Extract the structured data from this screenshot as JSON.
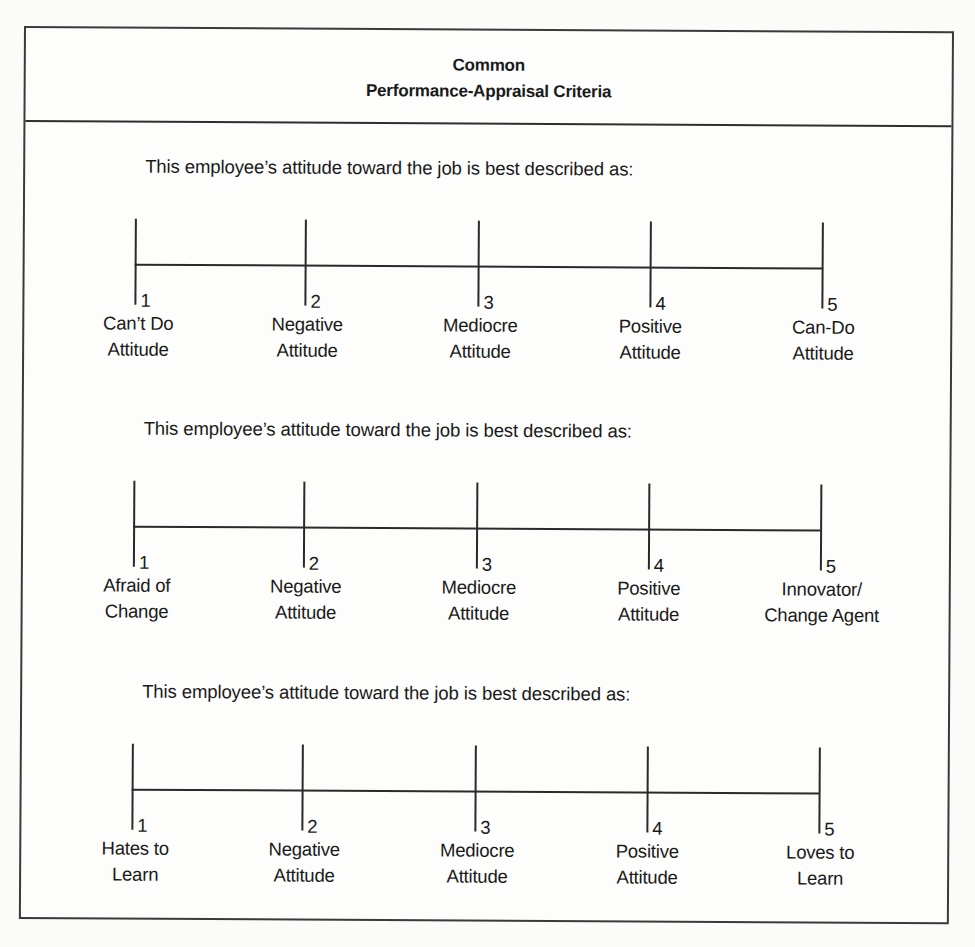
{
  "document": {
    "title_line1": "Common",
    "title_line2": "Performance-Appraisal Criteria"
  },
  "scales": [
    {
      "prompt": "This employee’s attitude toward the job is best described as:",
      "points": [
        {
          "number": "1",
          "label_line1": "Can’t Do",
          "label_line2": "Attitude"
        },
        {
          "number": "2",
          "label_line1": "Negative",
          "label_line2": "Attitude"
        },
        {
          "number": "3",
          "label_line1": "Mediocre",
          "label_line2": "Attitude"
        },
        {
          "number": "4",
          "label_line1": "Positive",
          "label_line2": "Attitude"
        },
        {
          "number": "5",
          "label_line1": "Can-Do",
          "label_line2": "Attitude"
        }
      ]
    },
    {
      "prompt": "This employee’s attitude toward the job is best described as:",
      "points": [
        {
          "number": "1",
          "label_line1": "Afraid of",
          "label_line2": "Change"
        },
        {
          "number": "2",
          "label_line1": "Negative",
          "label_line2": "Attitude"
        },
        {
          "number": "3",
          "label_line1": "Mediocre",
          "label_line2": "Attitude"
        },
        {
          "number": "4",
          "label_line1": "Positive",
          "label_line2": "Attitude"
        },
        {
          "number": "5",
          "label_line1": "Innovator/",
          "label_line2": "Change Agent"
        }
      ]
    },
    {
      "prompt": "This employee’s attitude toward the job is best described as:",
      "points": [
        {
          "number": "1",
          "label_line1": "Hates to",
          "label_line2": "Learn"
        },
        {
          "number": "2",
          "label_line1": "Negative",
          "label_line2": "Attitude"
        },
        {
          "number": "3",
          "label_line1": "Mediocre",
          "label_line2": "Attitude"
        },
        {
          "number": "4",
          "label_line1": "Positive",
          "label_line2": "Attitude"
        },
        {
          "number": "5",
          "label_line1": "Loves to",
          "label_line2": "Learn"
        }
      ]
    }
  ]
}
